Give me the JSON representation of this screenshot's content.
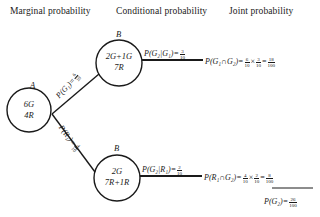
{
  "headers": {
    "marginal": "Marginal probability",
    "conditional": "Conditional probability",
    "joint": "Joint probability"
  },
  "nodes": {
    "a": {
      "label": "A",
      "line1": "6G",
      "line2": "4R"
    },
    "b_upper": {
      "label": "B",
      "line1": "2G+1G",
      "line2": "7R"
    },
    "b_lower": {
      "label": "B",
      "line1": "2G",
      "line2": "7R+1R"
    }
  },
  "branches": {
    "g1": {
      "prefix": "P(G₁)=",
      "num": "6",
      "den": "10"
    },
    "r1": {
      "prefix": "P(R₁)=",
      "num": "4",
      "den": "10"
    }
  },
  "conditional": {
    "g2_given_g1": {
      "prefix": "P(G₂|G₁)=",
      "num": "3",
      "den": "10"
    },
    "g2_given_r1": {
      "prefix": "P(G₂|R₁)=",
      "num": "2",
      "den": "10"
    }
  },
  "joint": {
    "g1_and_g2": {
      "prefix": "P(G₁∩G₂)=",
      "a_num": "6",
      "a_den": "10",
      "times": "×",
      "b_num": "3",
      "b_den": "10",
      "eq": "=",
      "r_num": "18",
      "r_den": "100"
    },
    "r1_and_g2": {
      "prefix": "P(R₁∩G₂)=",
      "a_num": "4",
      "a_den": "10",
      "times": "×",
      "b_num": "2",
      "b_den": "10",
      "eq": "=",
      "r_num": "8",
      "r_den": "100"
    },
    "total": {
      "prefix": "P(G₂)=",
      "num": "26",
      "den": "100"
    }
  }
}
